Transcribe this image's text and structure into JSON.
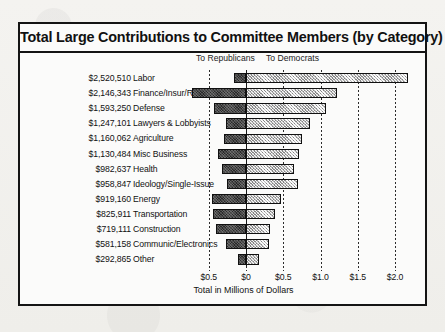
{
  "chart": {
    "title": "Total Large Contributions to Committee Members (by Category)",
    "legend": {
      "republicans": "To Republicans",
      "democrats": "To Democrats"
    },
    "axis_title": "Total in Millions of Dollars"
  },
  "chart_data": {
    "type": "bar",
    "orientation": "horizontal",
    "subtype": "diverging-stacked",
    "title": "Total Large Contributions to Committee Members (by Category)",
    "xlabel": "Total in Millions of Dollars",
    "ylabel": "",
    "xlim": [
      -0.62,
      2.18
    ],
    "grid": true,
    "legend_position": "top",
    "tick_labels": [
      "$0.5",
      "$0",
      "$0.5",
      "$1.0",
      "$1.5",
      "$2.0"
    ],
    "tick_values": [
      -0.5,
      0,
      0.5,
      1.0,
      1.5,
      2.0
    ],
    "categories": [
      "Labor",
      "Finance/Insur/Real Est",
      "Defense",
      "Lawyers & Lobbyists",
      "Agriculture",
      "Misc Business",
      "Health",
      "Ideology/Single-Issue",
      "Energy",
      "Transportation",
      "Construction",
      "Communic/Electronics",
      "Other"
    ],
    "totals_label": [
      "$2,520,510",
      "$2,146,343",
      "$1,593,250",
      "$1,247,101",
      "$1,160,062",
      "$1,130,484",
      "$982,637",
      "$958,847",
      "$919,160",
      "$825,911",
      "$719,111",
      "$581,158",
      "$292,865"
    ],
    "totals": [
      2520510,
      2146343,
      1593250,
      1247101,
      1160062,
      1130484,
      982637,
      958847,
      919160,
      825911,
      719111,
      581158,
      292865
    ],
    "series": [
      {
        "name": "To Republicans",
        "values": [
          0.16,
          0.72,
          0.43,
          0.27,
          0.3,
          0.38,
          0.32,
          0.25,
          0.45,
          0.44,
          0.4,
          0.27,
          0.11
        ]
      },
      {
        "name": "To Democrats",
        "values": [
          2.18,
          1.22,
          1.08,
          0.86,
          0.75,
          0.71,
          0.64,
          0.7,
          0.47,
          0.39,
          0.32,
          0.31,
          0.18
        ]
      }
    ]
  }
}
